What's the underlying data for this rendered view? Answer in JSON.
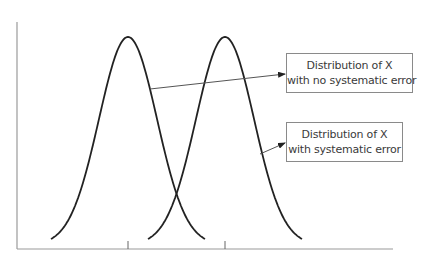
{
  "diagram": {
    "type": "distribution-comparison",
    "axes": {
      "x_axis": {
        "x1": 17,
        "x2": 393,
        "y": 249,
        "color": "#9a9a9a"
      },
      "y_axis": {
        "x": 17,
        "y1": 22,
        "y2": 249,
        "color": "#9a9a9a"
      },
      "ticks": [
        {
          "x": 128,
          "y1": 241,
          "y2": 249
        },
        {
          "x": 225,
          "y1": 241,
          "y2": 249
        }
      ]
    },
    "curves": [
      {
        "name": "distribution-no-systematic-error",
        "center": 128,
        "sigma": 29,
        "half_span": 77,
        "peak_y": 37,
        "end_y": 239,
        "color": "#222222"
      },
      {
        "name": "distribution-systematic-error",
        "center": 225,
        "sigma": 29,
        "half_span": 77,
        "peak_y": 37,
        "end_y": 239,
        "color": "#222222"
      }
    ],
    "labels": [
      {
        "id": "no-error",
        "line1": "Distribution of X",
        "line2": "with no systematic error",
        "arrow": {
          "x1": 150,
          "y1": 89,
          "x2": 285,
          "y2": 74
        }
      },
      {
        "id": "error",
        "line1": "Distribution of X",
        "line2": "with systematic error",
        "arrow": {
          "x1": 260,
          "y1": 154,
          "x2": 285,
          "y2": 143
        }
      }
    ]
  }
}
